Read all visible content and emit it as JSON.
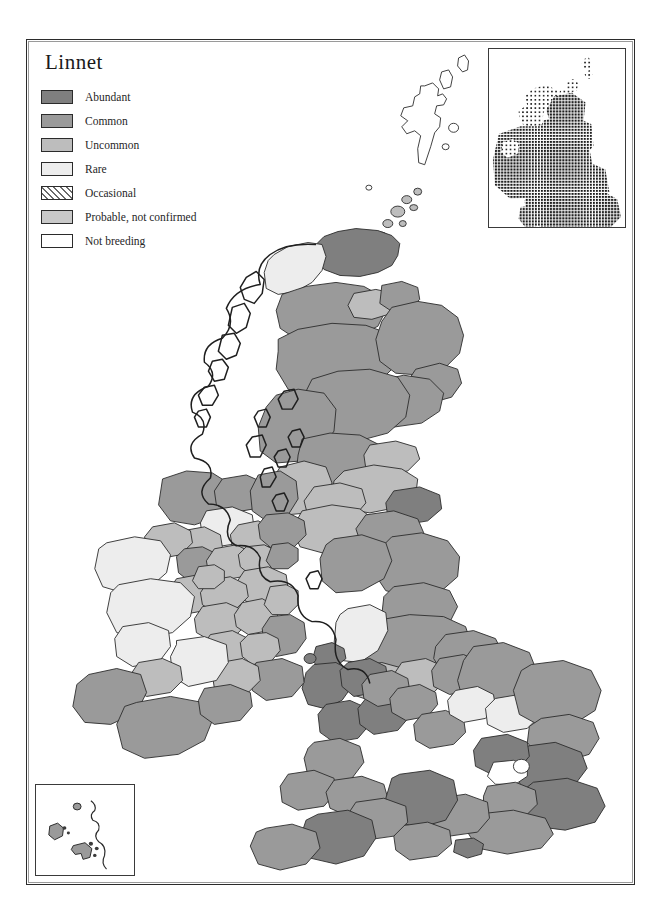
{
  "title": "Linnet",
  "legend": {
    "items": [
      {
        "label": "Abundant",
        "color": "#7f7f7f",
        "pattern": "solid"
      },
      {
        "label": "Common",
        "color": "#9a9a9a",
        "pattern": "solid"
      },
      {
        "label": "Uncommon",
        "color": "#bdbdbd",
        "pattern": "solid"
      },
      {
        "label": "Rare",
        "color": "#ededed",
        "pattern": "solid"
      },
      {
        "label": "Occasional",
        "color": "#ffffff",
        "pattern": "diagonal-hatch"
      },
      {
        "label": "Probable, not confirmed",
        "color": "#c9c9c9",
        "pattern": "solid"
      },
      {
        "label": "Not breeding",
        "color": "#ffffff",
        "pattern": "solid"
      }
    ]
  },
  "insets": {
    "distribution": {
      "name": "distribution-dot-map",
      "description": "Dot density distribution of Linnet across Britain and Ireland"
    },
    "islands": {
      "name": "channel-islands-inset",
      "description": "Channel Islands inset"
    }
  },
  "map": {
    "name": "britain-ireland-abundance-map",
    "regions": [
      {
        "id": "shetland",
        "class": "not-breeding",
        "color": "#ffffff"
      },
      {
        "id": "orkney",
        "class": "uncommon",
        "color": "#bdbdbd"
      },
      {
        "id": "outer-hebrides",
        "class": "not-breeding",
        "color": "#ffffff"
      },
      {
        "id": "caithness",
        "class": "abundant",
        "color": "#7f7f7f"
      },
      {
        "id": "sutherland",
        "class": "rare",
        "color": "#ededed"
      },
      {
        "id": "ross-cromarty",
        "class": "common",
        "color": "#9a9a9a"
      },
      {
        "id": "inverness",
        "class": "common",
        "color": "#9a9a9a"
      },
      {
        "id": "moray-nairn",
        "class": "uncommon",
        "color": "#bdbdbd"
      },
      {
        "id": "banff",
        "class": "common",
        "color": "#9a9a9a"
      },
      {
        "id": "aberdeen",
        "class": "common",
        "color": "#9a9a9a"
      },
      {
        "id": "kincardine",
        "class": "common",
        "color": "#9a9a9a"
      },
      {
        "id": "angus",
        "class": "common",
        "color": "#9a9a9a"
      },
      {
        "id": "perth",
        "class": "common",
        "color": "#9a9a9a"
      },
      {
        "id": "argyll",
        "class": "common",
        "color": "#9a9a9a"
      },
      {
        "id": "stirling",
        "class": "common",
        "color": "#9a9a9a"
      },
      {
        "id": "fife",
        "class": "uncommon",
        "color": "#bdbdbd"
      },
      {
        "id": "lothian",
        "class": "uncommon",
        "color": "#bdbdbd"
      },
      {
        "id": "ayr",
        "class": "uncommon",
        "color": "#bdbdbd"
      },
      {
        "id": "lanark",
        "class": "uncommon",
        "color": "#bdbdbd"
      },
      {
        "id": "berwick",
        "class": "abundant",
        "color": "#7f7f7f"
      },
      {
        "id": "dumfries",
        "class": "uncommon",
        "color": "#bdbdbd"
      },
      {
        "id": "roxburgh",
        "class": "common",
        "color": "#9a9a9a"
      },
      {
        "id": "northumberland",
        "class": "common",
        "color": "#9a9a9a"
      },
      {
        "id": "cumberland",
        "class": "common",
        "color": "#9a9a9a"
      },
      {
        "id": "durham",
        "class": "common",
        "color": "#9a9a9a"
      },
      {
        "id": "yorkshire-north",
        "class": "common",
        "color": "#9a9a9a"
      },
      {
        "id": "yorkshire-east",
        "class": "common",
        "color": "#9a9a9a"
      },
      {
        "id": "lancashire",
        "class": "rare",
        "color": "#ededed"
      },
      {
        "id": "cheshire",
        "class": "uncommon",
        "color": "#bdbdbd"
      },
      {
        "id": "derby",
        "class": "uncommon",
        "color": "#bdbdbd"
      },
      {
        "id": "nottingham",
        "class": "common",
        "color": "#9a9a9a"
      },
      {
        "id": "lincoln",
        "class": "common",
        "color": "#9a9a9a"
      },
      {
        "id": "anglesey",
        "class": "abundant",
        "color": "#7f7f7f"
      },
      {
        "id": "caernarvon",
        "class": "abundant",
        "color": "#7f7f7f"
      },
      {
        "id": "denbigh",
        "class": "abundant",
        "color": "#7f7f7f"
      },
      {
        "id": "merioneth",
        "class": "abundant",
        "color": "#7f7f7f"
      },
      {
        "id": "montgomery",
        "class": "abundant",
        "color": "#7f7f7f"
      },
      {
        "id": "cardigan",
        "class": "common",
        "color": "#9a9a9a"
      },
      {
        "id": "pembroke",
        "class": "common",
        "color": "#9a9a9a"
      },
      {
        "id": "glamorgan",
        "class": "common",
        "color": "#9a9a9a"
      },
      {
        "id": "shropshire",
        "class": "common",
        "color": "#9a9a9a"
      },
      {
        "id": "stafford",
        "class": "common",
        "color": "#9a9a9a"
      },
      {
        "id": "warwick",
        "class": "common",
        "color": "#9a9a9a"
      },
      {
        "id": "leicester",
        "class": "rare",
        "color": "#ededed"
      },
      {
        "id": "norfolk",
        "class": "common",
        "color": "#9a9a9a"
      },
      {
        "id": "suffolk",
        "class": "common",
        "color": "#9a9a9a"
      },
      {
        "id": "cambridge",
        "class": "rare",
        "color": "#ededed"
      },
      {
        "id": "essex",
        "class": "abundant",
        "color": "#7f7f7f"
      },
      {
        "id": "hertford",
        "class": "abundant",
        "color": "#7f7f7f"
      },
      {
        "id": "middlesex",
        "class": "not-breeding",
        "color": "#ffffff"
      },
      {
        "id": "kent",
        "class": "abundant",
        "color": "#7f7f7f"
      },
      {
        "id": "surrey",
        "class": "common",
        "color": "#9a9a9a"
      },
      {
        "id": "sussex",
        "class": "common",
        "color": "#9a9a9a"
      },
      {
        "id": "hampshire",
        "class": "common",
        "color": "#9a9a9a"
      },
      {
        "id": "wiltshire",
        "class": "abundant",
        "color": "#7f7f7f"
      },
      {
        "id": "dorset",
        "class": "common",
        "color": "#9a9a9a"
      },
      {
        "id": "somerset",
        "class": "common",
        "color": "#9a9a9a"
      },
      {
        "id": "devon",
        "class": "abundant",
        "color": "#7f7f7f"
      },
      {
        "id": "cornwall",
        "class": "common",
        "color": "#9a9a9a"
      },
      {
        "id": "isle-of-wight",
        "class": "abundant",
        "color": "#7f7f7f"
      },
      {
        "id": "donegal",
        "class": "common",
        "color": "#9a9a9a"
      },
      {
        "id": "derry",
        "class": "common",
        "color": "#9a9a9a"
      },
      {
        "id": "antrim",
        "class": "common",
        "color": "#9a9a9a"
      },
      {
        "id": "tyrone",
        "class": "rare",
        "color": "#ededed"
      },
      {
        "id": "fermanagh",
        "class": "uncommon",
        "color": "#bdbdbd"
      },
      {
        "id": "armagh",
        "class": "uncommon",
        "color": "#bdbdbd"
      },
      {
        "id": "down",
        "class": "common",
        "color": "#9a9a9a"
      },
      {
        "id": "sligo",
        "class": "uncommon",
        "color": "#bdbdbd"
      },
      {
        "id": "leitrim",
        "class": "common",
        "color": "#9a9a9a"
      },
      {
        "id": "mayo",
        "class": "rare",
        "color": "#ededed"
      },
      {
        "id": "roscommon",
        "class": "uncommon",
        "color": "#bdbdbd"
      },
      {
        "id": "cavan",
        "class": "uncommon",
        "color": "#bdbdbd"
      },
      {
        "id": "monaghan",
        "class": "uncommon",
        "color": "#bdbdbd"
      },
      {
        "id": "louth",
        "class": "common",
        "color": "#9a9a9a"
      },
      {
        "id": "meath",
        "class": "uncommon",
        "color": "#bdbdbd"
      },
      {
        "id": "westmeath",
        "class": "uncommon",
        "color": "#bdbdbd"
      },
      {
        "id": "longford",
        "class": "uncommon",
        "color": "#bdbdbd"
      },
      {
        "id": "galway",
        "class": "rare",
        "color": "#ededed"
      },
      {
        "id": "offaly",
        "class": "uncommon",
        "color": "#bdbdbd"
      },
      {
        "id": "kildare",
        "class": "uncommon",
        "color": "#bdbdbd"
      },
      {
        "id": "dublin",
        "class": "uncommon",
        "color": "#bdbdbd"
      },
      {
        "id": "wicklow",
        "class": "common",
        "color": "#9a9a9a"
      },
      {
        "id": "laois",
        "class": "uncommon",
        "color": "#bdbdbd"
      },
      {
        "id": "carlow",
        "class": "uncommon",
        "color": "#bdbdbd"
      },
      {
        "id": "wexford",
        "class": "common",
        "color": "#9a9a9a"
      },
      {
        "id": "kilkenny",
        "class": "uncommon",
        "color": "#bdbdbd"
      },
      {
        "id": "tipperary",
        "class": "rare",
        "color": "#ededed"
      },
      {
        "id": "clare",
        "class": "rare",
        "color": "#ededed"
      },
      {
        "id": "limerick",
        "class": "uncommon",
        "color": "#bdbdbd"
      },
      {
        "id": "kerry",
        "class": "common",
        "color": "#9a9a9a"
      },
      {
        "id": "cork",
        "class": "common",
        "color": "#9a9a9a"
      },
      {
        "id": "waterford",
        "class": "common",
        "color": "#9a9a9a"
      }
    ]
  }
}
